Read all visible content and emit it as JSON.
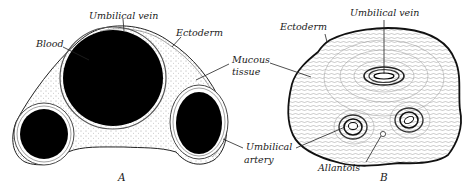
{
  "figure_a": {
    "caption": "A",
    "labels": {
      "umbilical_vein": "Umbilical vein",
      "blood": "Blood",
      "ectoderm": "Ectoderm",
      "mucous_line1": "Mucous",
      "mucous_line2": "tissue",
      "artery_line1": "Umbilical",
      "artery_line2": "artery"
    }
  },
  "figure_b": {
    "caption": "B",
    "labels": {
      "umbilical_vein": "Umbilical vein",
      "ectoderm": "Ectoderm",
      "allantois": "Allantois"
    }
  },
  "colors": {
    "ink": "#1a1a1a",
    "blood": "#000000",
    "background": "#ffffff"
  }
}
